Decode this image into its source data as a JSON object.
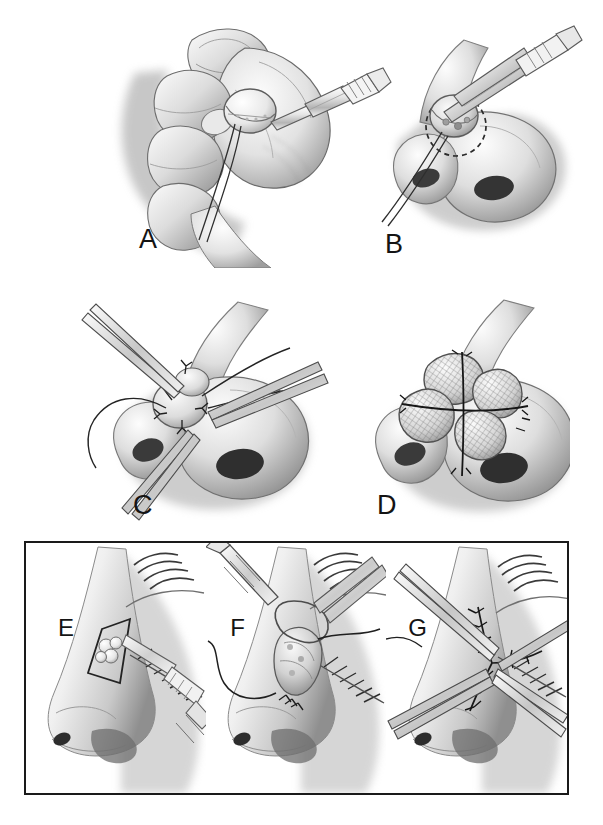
{
  "figure": {
    "type": "medical-surgical-illustration",
    "medium": "graphite pencil rendering, grayscale",
    "background_color": "#ffffff",
    "frame_color": "#1a1a1a",
    "faint_top_right_caption": ""
  },
  "panels": [
    {
      "id": "A",
      "label": "A",
      "label_x": 139,
      "label_y": 226,
      "x": 95,
      "y": 18,
      "w": 300,
      "h": 250,
      "title": "Harvested cartilage graft held in hand with scalpel",
      "contents": [
        "hand holding graft between thumb and fingers",
        "round cartilage graft disc",
        "scalpel blade and handle",
        "two fine needle/suture strands trailing down"
      ]
    },
    {
      "id": "B",
      "label": "B",
      "label_x": 385,
      "label_y": 231,
      "x": 375,
      "y": 30,
      "w": 215,
      "h": 210,
      "title": "Graft positioned on nasal tip with forceps over dashed recipient outline",
      "contents": [
        "forceps grasping graft",
        "dashed circular recipient site outline on nasal tip",
        "nose frontal-oblique view with nostrils",
        "suture strands to lower left"
      ]
    },
    {
      "id": "C",
      "label": "C",
      "label_x": 133,
      "label_y": 492,
      "x": 70,
      "y": 300,
      "w": 260,
      "h": 215,
      "title": "Graft secured with interrupted sutures, needles and long strands in place",
      "contents": [
        "nose with graft sutured to tip",
        "curved suture needles",
        "long looping suture threads on both sides",
        "needle holder tips"
      ]
    },
    {
      "id": "D",
      "label": "D",
      "label_x": 377,
      "label_y": 492,
      "x": 345,
      "y": 300,
      "w": 225,
      "h": 215,
      "title": "Final four-quadrant cross-hatched graft sutured over nasal tip",
      "contents": [
        "four lobed cross-hatched graft segments",
        "cruciform suture lines dividing quadrants",
        "nose frontal view"
      ]
    },
    {
      "id": "E",
      "label": "E",
      "label_x": 57,
      "label_y": 616,
      "frame_left_pct": 0,
      "frame_width_pct": 33.3,
      "title": "Rhomboid excision outline around lobulated nasal sidewall lesion",
      "contents": [
        "profile of nose and eye with eyelashes and brow",
        "diamond/rhomboid excision marking",
        "lobulated lesion inside outline",
        "scalpel blade at lesion margin"
      ]
    },
    {
      "id": "F",
      "label": "F",
      "label_x": 232,
      "label_y": 616,
      "frame_left_pct": 33.3,
      "frame_width_pct": 33.3,
      "title": "Lesion elevated with forceps and excised while suture is passed",
      "contents": [
        "forceps elevating the lesion",
        "scalpel/electrocautery pen above",
        "long curving suture thread",
        "partial stitches at wound base"
      ]
    },
    {
      "id": "G",
      "label": "G",
      "label_x": 432,
      "label_y": 616,
      "frame_left_pct": 66.6,
      "frame_width_pct": 33.4,
      "title": "Completed layered closure with interrupted sutures and needle holders",
      "contents": [
        "Y-shaped / stellate sutured closure line",
        "multiple interrupted stitches with knot tails",
        "two pairs of instrument shafts converging",
        "eye with lashes at right"
      ]
    }
  ],
  "colors": {
    "ink": "#141414",
    "graphite_dark": "#4a4a4a",
    "graphite_mid": "#8a8a8a",
    "graphite_light": "#c9c9c9",
    "skin_highlight": "#fbfbfb",
    "frame": "#1a1a1a"
  }
}
